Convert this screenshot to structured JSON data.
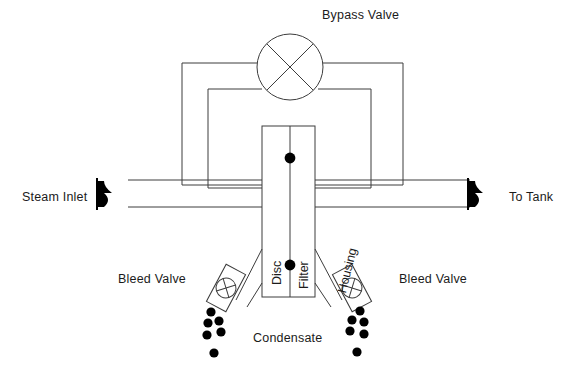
{
  "diagram": {
    "title_label": "Bypass Valve",
    "colors": {
      "line": "#3c3c3c",
      "text": "#1b1b1b",
      "marker": "#000000",
      "background": "#ffffff"
    },
    "labels": {
      "bypass_valve": "Bypass Valve",
      "steam_inlet": "Steam Inlet",
      "to_tank": "To Tank",
      "bleed_valve_left": "Bleed Valve",
      "bleed_valve_right": "Bleed Valve",
      "condensate": "Condensate",
      "disc": "Disc",
      "filter": "Filter",
      "housing": "Housing"
    },
    "icons": {
      "inlet_arrow": "flow-arrow-right-icon",
      "outlet_arrow": "flow-arrow-right-icon",
      "bypass_valve_symbol": "globe-valve-circle-x-icon",
      "bleed_valve_left_symbol": "gate-valve-circle-x-icon",
      "bleed_valve_right_symbol": "gate-valve-circle-x-icon",
      "condensate_droplet": "droplet-dot-icon"
    },
    "geometry": {
      "canvas": [
        573,
        381
      ],
      "main_pipe": {
        "top_y": 180,
        "bottom_y": 207,
        "x_start": 128,
        "x_end": 470
      },
      "housing_column": {
        "x1": 262,
        "x2": 315,
        "y_top": 126,
        "y_bottom": 297,
        "center_x": 290
      },
      "bypass_circle": {
        "cx": 290,
        "cy": 67,
        "r": 33
      },
      "outer_loop": {
        "y": 63,
        "left_x": 182,
        "right_x": 403,
        "bottom_y": 185
      },
      "inner_loop": {
        "y": 89,
        "left_x": 208,
        "right_x": 371,
        "bottom_y": 188
      },
      "center_dots": [
        {
          "x": 290,
          "y": 158
        },
        {
          "x": 290,
          "y": 265
        }
      ],
      "left_bleed_valve": {
        "cx": 226,
        "cy": 288,
        "r": 9,
        "angle": -42
      },
      "right_bleed_valve": {
        "cx": 352,
        "cy": 288,
        "r": 9,
        "angle": 42
      },
      "droplets_left": [
        [
          211,
          312
        ],
        [
          219,
          321
        ],
        [
          208,
          323
        ],
        [
          221,
          332
        ],
        [
          207,
          335
        ],
        [
          214,
          353
        ]
      ],
      "droplets_right": [
        [
          360,
          311
        ],
        [
          352,
          320
        ],
        [
          364,
          322
        ],
        [
          350,
          331
        ],
        [
          364,
          334
        ],
        [
          357,
          352
        ]
      ],
      "droplet_radius": 4.6
    }
  }
}
